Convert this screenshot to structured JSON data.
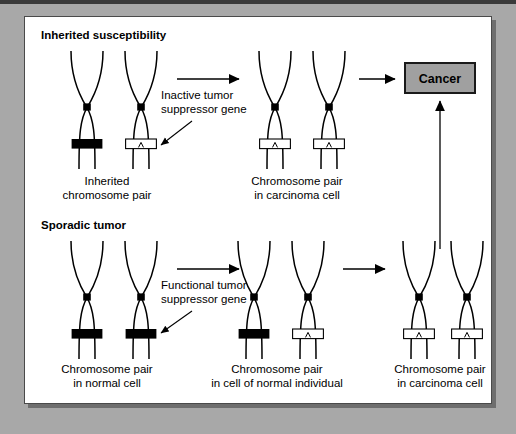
{
  "figure": {
    "background_color": "#a8a8a8",
    "panel_color": "#ffffff",
    "accent_box_color": "#a0a0a0",
    "band_active_color": "#000000",
    "band_inactive_color": "#ffffff"
  },
  "sections": {
    "inherited": {
      "title": "Inherited susceptibility",
      "annotation": {
        "line1": "Inactive tumor",
        "line2": "suppressor gene"
      },
      "stages": [
        {
          "id": "inherited-pair",
          "label_line1": "Inherited",
          "label_line2": "chromosome pair",
          "chromosomes": [
            {
              "band": "active"
            },
            {
              "band": "inactive"
            }
          ]
        },
        {
          "id": "inherited-carcinoma",
          "label_line1": "Chromosome pair",
          "label_line2": "in carcinoma cell",
          "chromosomes": [
            {
              "band": "inactive"
            },
            {
              "band": "inactive"
            }
          ]
        }
      ]
    },
    "sporadic": {
      "title": "Sporadic tumor",
      "annotation": {
        "line1": "Functional tumor",
        "line2": "suppressor gene"
      },
      "stages": [
        {
          "id": "sporadic-normal",
          "label_line1": "Chromosome pair",
          "label_line2": "in normal cell",
          "chromosomes": [
            {
              "band": "active"
            },
            {
              "band": "active"
            }
          ]
        },
        {
          "id": "sporadic-normal-individual",
          "label_line1": "Chromosome pair",
          "label_line2": "in cell of normal individual",
          "chromosomes": [
            {
              "band": "active"
            },
            {
              "band": "inactive"
            }
          ]
        },
        {
          "id": "sporadic-carcinoma",
          "label_line1": "Chromosome pair",
          "label_line2": "in carcinoma cell",
          "chromosomes": [
            {
              "band": "inactive"
            },
            {
              "band": "inactive"
            }
          ]
        }
      ]
    }
  },
  "outcome": {
    "label": "Cancer"
  }
}
